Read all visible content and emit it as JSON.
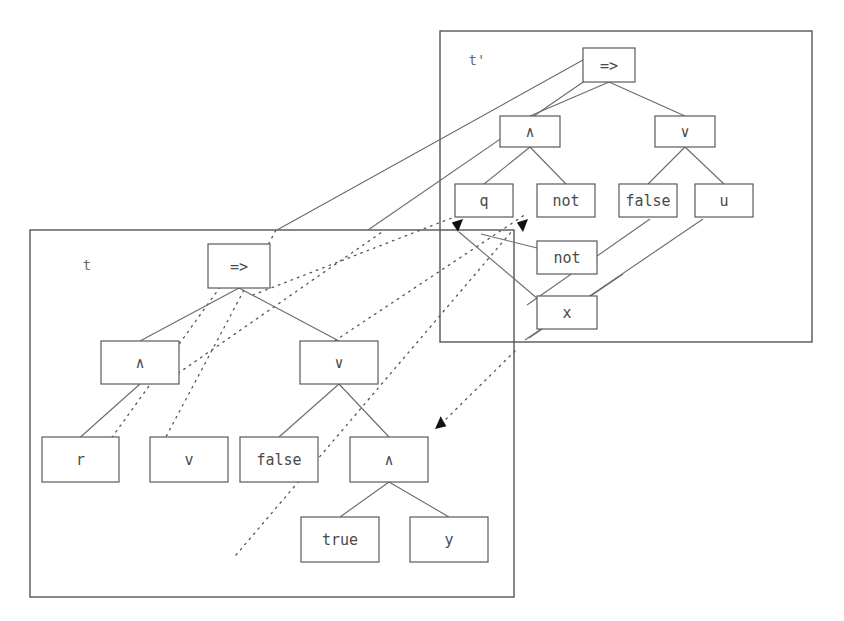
{
  "figure": {
    "type": "term-rewriting-diagram"
  },
  "frames": [
    {
      "id": "frame-t-prime",
      "label": "t'",
      "label_x": 477,
      "label_y": 61,
      "x": 440,
      "y": 31,
      "width": 372,
      "height": 311
    },
    {
      "id": "frame-t",
      "label": "t",
      "label_x": 87,
      "label_y": 266,
      "x": 30,
      "y": 230,
      "width": 484,
      "height": 367
    }
  ],
  "trees": {
    "t_prime": {
      "name": "t'",
      "nodes": [
        {
          "id": "tp-imp",
          "label": "=>",
          "x": 583,
          "y": 48,
          "w": 52,
          "h": 34
        },
        {
          "id": "tp-and",
          "label": "∧",
          "x": 500,
          "y": 116,
          "w": 60,
          "h": 31
        },
        {
          "id": "tp-or",
          "label": "∨",
          "x": 655,
          "y": 116,
          "w": 60,
          "h": 31
        },
        {
          "id": "tp-q",
          "label": "q",
          "x": 455,
          "y": 184,
          "w": 58,
          "h": 33
        },
        {
          "id": "tp-not1",
          "label": "not",
          "x": 537,
          "y": 184,
          "w": 58,
          "h": 33
        },
        {
          "id": "tp-false",
          "label": "false",
          "x": 619,
          "y": 184,
          "w": 58,
          "h": 33
        },
        {
          "id": "tp-u",
          "label": "u",
          "x": 695,
          "y": 184,
          "w": 58,
          "h": 33
        },
        {
          "id": "tp-not2",
          "label": "not",
          "x": 537,
          "y": 241,
          "w": 60,
          "h": 33
        },
        {
          "id": "tp-x",
          "label": "x",
          "x": 537,
          "y": 296,
          "w": 60,
          "h": 33
        }
      ],
      "edges": [
        {
          "from": "tp-imp",
          "to": "tp-and"
        },
        {
          "from": "tp-imp",
          "to": "tp-or"
        },
        {
          "from": "tp-and",
          "to": "tp-q"
        },
        {
          "from": "tp-and",
          "to": "tp-not1"
        },
        {
          "from": "tp-or",
          "to": "tp-false"
        },
        {
          "from": "tp-or",
          "to": "tp-u"
        }
      ]
    },
    "t": {
      "name": "t",
      "nodes": [
        {
          "id": "t-imp",
          "label": "=>",
          "x": 208,
          "y": 244,
          "w": 62,
          "h": 44
        },
        {
          "id": "t-and",
          "label": "∧",
          "x": 101,
          "y": 341,
          "w": 78,
          "h": 43
        },
        {
          "id": "t-or",
          "label": "∨",
          "x": 300,
          "y": 341,
          "w": 78,
          "h": 43
        },
        {
          "id": "t-r",
          "label": "r",
          "x": 42,
          "y": 437,
          "w": 77,
          "h": 45
        },
        {
          "id": "t-v",
          "label": "v",
          "x": 150,
          "y": 437,
          "w": 78,
          "h": 45
        },
        {
          "id": "t-false",
          "label": "false",
          "x": 240,
          "y": 437,
          "w": 78,
          "h": 45
        },
        {
          "id": "t-and2",
          "label": "∧",
          "x": 350,
          "y": 437,
          "w": 78,
          "h": 45
        },
        {
          "id": "t-true",
          "label": "true",
          "x": 301,
          "y": 517,
          "w": 78,
          "h": 45
        },
        {
          "id": "t-y",
          "label": "y",
          "x": 410,
          "y": 517,
          "w": 78,
          "h": 45
        }
      ],
      "edges": [
        {
          "from": "t-imp",
          "to": "t-and"
        },
        {
          "from": "t-imp",
          "to": "t-or"
        },
        {
          "from": "t-and",
          "to": "t-r"
        },
        {
          "from": "t-or",
          "to": "t-false"
        },
        {
          "from": "t-or",
          "to": "t-and2"
        },
        {
          "from": "t-and2",
          "to": "t-true"
        },
        {
          "from": "t-and2",
          "to": "t-y"
        }
      ]
    }
  },
  "mapping_solid": [
    {
      "id": "solid-1",
      "x1": 277,
      "y1": 230,
      "x2": 583,
      "y2": 60,
      "arrow": false
    },
    {
      "id": "solid-2",
      "x1": 368,
      "y1": 230,
      "x2": 589,
      "y2": 78,
      "arrow": false
    },
    {
      "id": "solid-3",
      "x1": 529,
      "y1": 338,
      "x2": 623,
      "y2": 274,
      "arrow": false
    },
    {
      "id": "solid-4",
      "x1": 525,
      "y1": 340,
      "x2": 703,
      "y2": 219,
      "arrow": false
    },
    {
      "id": "solid-5",
      "x1": 527,
      "y1": 305,
      "x2": 650,
      "y2": 219,
      "arrow": false
    },
    {
      "id": "solid-6",
      "x1": 459,
      "y1": 232,
      "x2": 545,
      "y2": 305,
      "arrow": false
    },
    {
      "id": "solid-7",
      "x1": 481,
      "y1": 234,
      "x2": 545,
      "y2": 250,
      "arrow": false
    }
  ],
  "mapping_dotted": [
    {
      "id": "dot-1",
      "x1": 160,
      "y1": 448,
      "x2": 276,
      "y2": 230
    },
    {
      "id": "dot-2",
      "x1": 108,
      "y1": 443,
      "x2": 246,
      "y2": 251
    },
    {
      "id": "dot-3",
      "x1": 167,
      "y1": 381,
      "x2": 382,
      "y2": 232
    },
    {
      "id": "dot-4",
      "x1": 253,
      "y1": 295,
      "x2": 462,
      "y2": 214
    },
    {
      "id": "dot-5",
      "x1": 318,
      "y1": 352,
      "x2": 526,
      "y2": 214
    },
    {
      "id": "dot-6",
      "x1": 236,
      "y1": 555,
      "x2": 512,
      "y2": 231
    },
    {
      "id": "dot-7",
      "x1": 515,
      "y1": 351,
      "x2": 438,
      "y2": 427
    }
  ],
  "arrowheads": [
    {
      "id": "arrow-to-q",
      "x": 463,
      "y": 219,
      "angle": -48
    },
    {
      "id": "arrow-to-not",
      "x": 528,
      "y": 219,
      "angle": -48
    },
    {
      "id": "arrow-to-and2-t",
      "x": 435,
      "y": 429,
      "angle": 135
    }
  ],
  "colors": {
    "stroke": "#5a5a5a",
    "text": "#4a4a4a",
    "arrow": "#111111",
    "background": "#ffffff"
  }
}
